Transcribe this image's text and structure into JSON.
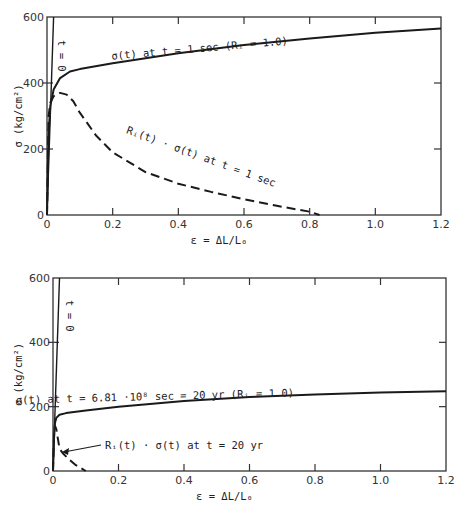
{
  "chart_data": [
    {
      "type": "line",
      "panel": "top",
      "xlabel": "ε = ΔL/L₀",
      "ylabel": "σ (kg/cm²)",
      "xlim": [
        0,
        1.2
      ],
      "ylim": [
        0,
        600
      ],
      "xticks": [
        "0",
        "0.2",
        "0.4",
        "0.6",
        "0.8",
        "1.0",
        "1.2"
      ],
      "yticks": [
        "0",
        "200",
        "400",
        "600"
      ],
      "grid": false,
      "series": [
        {
          "name": "t = 0",
          "style": "solid",
          "x": [
            0,
            0.02
          ],
          "y": [
            0,
            600
          ]
        },
        {
          "name": "σ(t) at t = 1 sec (Rᵢ = 1.0)",
          "style": "solid",
          "x": [
            0,
            0.005,
            0.01,
            0.02,
            0.04,
            0.07,
            0.1,
            0.2,
            0.4,
            0.6,
            0.8,
            1.0,
            1.2
          ],
          "y": [
            0,
            250,
            330,
            380,
            415,
            435,
            442,
            460,
            490,
            515,
            535,
            552,
            565
          ]
        },
        {
          "name": "Rᵢ(t) · σ(t) at t = 1 sec",
          "style": "dashed",
          "x": [
            0,
            0.005,
            0.01,
            0.02,
            0.04,
            0.06,
            0.08,
            0.1,
            0.15,
            0.2,
            0.3,
            0.4,
            0.5,
            0.6,
            0.7,
            0.8,
            0.83
          ],
          "y": [
            0,
            300,
            340,
            360,
            370,
            365,
            345,
            310,
            240,
            190,
            130,
            95,
            70,
            48,
            28,
            10,
            0
          ]
        }
      ],
      "annotations": [
        "t = 0",
        "σ(t) at t = 1 sec (Rᵢ = 1.0)",
        "Rᵢ(t) · σ(t) at t = 1 sec"
      ]
    },
    {
      "type": "line",
      "panel": "bottom",
      "xlabel": "ε = ΔL/L₀",
      "ylabel": "σ (kg/cm²)",
      "xlim": [
        0,
        1.2
      ],
      "ylim": [
        0,
        600
      ],
      "xticks": [
        "0",
        "0.2",
        "0.4",
        "0.6",
        "0.8",
        "1.0",
        "1.2"
      ],
      "yticks": [
        "0",
        "200",
        "400",
        "600"
      ],
      "grid": false,
      "series": [
        {
          "name": "t = 0",
          "style": "solid",
          "x": [
            0,
            0.02
          ],
          "y": [
            0,
            600
          ]
        },
        {
          "name": "σ(t) at t = 6.81·10⁸ sec = 20 yr (Rᵢ = 1.0)",
          "style": "solid",
          "x": [
            0,
            0.003,
            0.006,
            0.01,
            0.02,
            0.04,
            0.1,
            0.2,
            0.4,
            0.6,
            0.8,
            1.0,
            1.2
          ],
          "y": [
            0,
            100,
            150,
            165,
            175,
            180,
            188,
            200,
            218,
            230,
            238,
            244,
            248
          ]
        },
        {
          "name": "Rᵢ(t) · σ(t) at t = 20 yr",
          "style": "dashed",
          "x": [
            0,
            0.003,
            0.006,
            0.01,
            0.015,
            0.02,
            0.03,
            0.05,
            0.07,
            0.1
          ],
          "y": [
            0,
            110,
            140,
            130,
            100,
            70,
            55,
            35,
            18,
            0
          ]
        }
      ],
      "annotations": [
        "t = 0",
        "σ(t) at t = 6.81·10⁸ sec = 20 yr (Rᵢ = 1.0)",
        "Rᵢ(t) · σ(t) at t = 20 yr"
      ]
    }
  ],
  "top": {
    "ylabel": "σ (kg/cm²)",
    "xlabel": "ε = ΔL/L₀",
    "t0_label": "t = 0",
    "solid_label": "σ(t) at t = 1 sec (Rᵢ = 1.0)",
    "dashed_label": "Rᵢ(t) · σ(t) at t = 1 sec"
  },
  "bottom": {
    "ylabel": "σ (kg/cm²)",
    "xlabel": "ε = ΔL/L₀",
    "t0_label": "t = 0",
    "solid_label": "σ(t) at t = 6.81 ·10⁸ sec = 20 yr (Rᵢ = 1.0)",
    "dashed_label": "Rᵢ(t) · σ(t) at t = 20 yr"
  },
  "xtick_labels": [
    "0",
    "0.2",
    "0.4",
    "0.6",
    "0.8",
    "1.0",
    "1.2"
  ],
  "ytick_labels": [
    "0",
    "200",
    "400",
    "600"
  ]
}
